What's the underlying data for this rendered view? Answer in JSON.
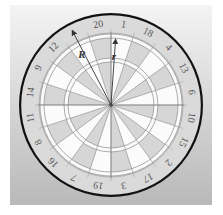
{
  "figure": {
    "width": 223,
    "height": 215,
    "background_panel": {
      "x": 10,
      "y": 5,
      "w": 202,
      "h": 200,
      "top_color": "#f4f4f4",
      "bottom_color": "#b9b9b9"
    },
    "center": {
      "x": 111,
      "y": 105
    }
  },
  "dartboard": {
    "segment_numbers": [
      20,
      1,
      18,
      4,
      13,
      6,
      10,
      15,
      2,
      17,
      3,
      19,
      7,
      16,
      8,
      11,
      14,
      9,
      12,
      5
    ],
    "hidden_labels": [
      5
    ],
    "segment_colors": {
      "even": "#d6d6d6",
      "odd": "#fbfbfb"
    },
    "radii": {
      "outer_black_rim": 92,
      "label_ring_inner": 72,
      "double_outer": 71,
      "double_inner": 67,
      "triple_outer": 47,
      "triple_inner": 43,
      "bull": 2
    },
    "colors": {
      "rim": "#111111",
      "label_ring": "#dadada",
      "ring_band": "#fafafa",
      "wire": "#8a8a8a",
      "label_text": "#555555"
    },
    "label_radius": 82
  },
  "annotations": {
    "R": {
      "label": "R",
      "angle_deg": -27.5,
      "length": 84,
      "label_pos": {
        "x": 82,
        "y": 58
      }
    },
    "r": {
      "label": "r",
      "angle_deg": 4,
      "length": 66,
      "label_pos": {
        "x": 114,
        "y": 60
      }
    },
    "arrow_color": "#333333"
  }
}
